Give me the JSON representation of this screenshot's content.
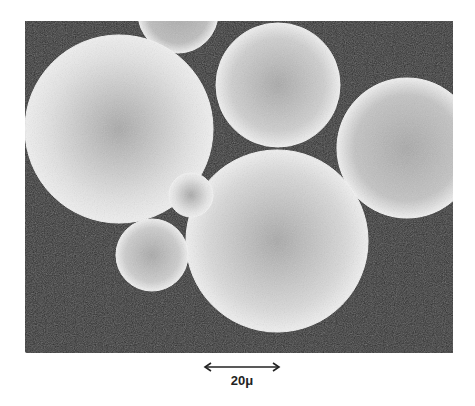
{
  "figure": {
    "background_color": "#2e2e2e",
    "sphere_color": "#d8d8d8",
    "spheres": [
      {
        "cx": 178,
        "cy": 13,
        "r": 40,
        "shade": "#bdbdbd"
      },
      {
        "cx": 119,
        "cy": 129,
        "r": 94,
        "shade": "#e2e2e2"
      },
      {
        "cx": 278,
        "cy": 85,
        "r": 62,
        "shade": "#cfcfcf"
      },
      {
        "cx": 407,
        "cy": 148,
        "r": 70,
        "shade": "#c4c4c4"
      },
      {
        "cx": 277,
        "cy": 241,
        "r": 91,
        "shade": "#d9d9d9"
      },
      {
        "cx": 152,
        "cy": 255,
        "r": 36,
        "shade": "#cdcdcd"
      },
      {
        "cx": 191,
        "cy": 195,
        "r": 22,
        "shade": "#e4e4e4"
      },
      {
        "cx": -20,
        "cy": 395,
        "r": 62,
        "shade": "#dcdcdc"
      }
    ]
  },
  "scale_bar": {
    "label": "20μ",
    "length_px": 74
  }
}
